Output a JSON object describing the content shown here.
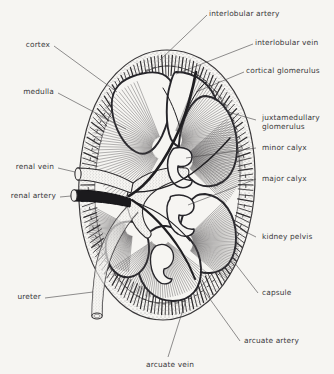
{
  "figure": {
    "type": "anatomical-line-diagram",
    "background_color": "#f6f5f2",
    "ink_color": "#2b2a2c",
    "text_color": "#39383a"
  },
  "labels": {
    "interlobular_artery": "interlobular artery",
    "interlobular_vein": "interlobular vein",
    "cortical_glomerulus": "cortical glomerulus",
    "juxtamedullary_glomerulus_line1": "juxtamedullary",
    "juxtamedullary_glomerulus_line2": "glomerulus",
    "minor_calyx": "minor calyx",
    "major_calyx": "major calyx",
    "kidney_pelvis": "kidney pelvis",
    "capsule": "capsule",
    "arcuate_artery": "arcuate artery",
    "arcuate_vein": "arcuate vein",
    "cortex": "cortex",
    "medulla": "medulla",
    "renal_vein": "renal vein",
    "renal_artery": "renal artery",
    "ureter": "ureter"
  },
  "structures": [
    {
      "name": "capsule",
      "description": "outer thin oval boundary of kidney"
    },
    {
      "name": "cortex",
      "description": "stippled outer zone with radial medullary ray ticks"
    },
    {
      "name": "medulla",
      "description": "renal pyramids with fine radial striations"
    },
    {
      "name": "renal-artery",
      "description": "dark filled tube entering hilum"
    },
    {
      "name": "renal-vein",
      "description": "light stippled tube entering hilum above artery"
    },
    {
      "name": "ureter",
      "description": "tube descending from pelvis at lower left"
    },
    {
      "name": "kidney-pelvis",
      "description": "funnel collecting space inside hilum"
    },
    {
      "name": "major-calyx",
      "description": "large branch of pelvis"
    },
    {
      "name": "minor-calyx",
      "description": "cup around papilla of pyramid"
    },
    {
      "name": "arcuate-artery",
      "description": "vessel arching at corticomedullary junction"
    },
    {
      "name": "arcuate-vein",
      "description": "vein arching at corticomedullary junction"
    },
    {
      "name": "interlobular-artery",
      "description": "radial artery ascending into cortex"
    },
    {
      "name": "interlobular-vein",
      "description": "radial vein ascending into cortex"
    },
    {
      "name": "cortical-glomerulus",
      "description": "glomerulus in outer cortex"
    },
    {
      "name": "juxtamedullary-glomerulus",
      "description": "glomerulus near corticomedullary junction"
    }
  ]
}
